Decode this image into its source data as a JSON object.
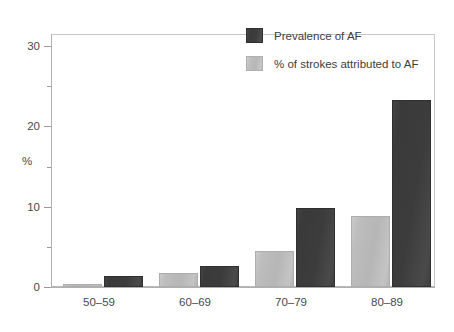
{
  "chart_data": {
    "type": "bar",
    "title": "",
    "subtitle": "",
    "xlabel": "",
    "ylabel": "%",
    "categories": [
      "50–59",
      "60–69",
      "70–79",
      "80–89"
    ],
    "series": [
      {
        "name": "Prevalence of AF",
        "color": "#3c3c3c",
        "values": [
          1.4,
          2.6,
          9.9,
          23.3
        ]
      },
      {
        "name": "% of strokes attributed to AF",
        "color": "#bdbdbd",
        "values": [
          0.4,
          1.7,
          4.5,
          8.8
        ]
      }
    ],
    "ylim": [
      0,
      31.5
    ],
    "yticks_major": [
      0,
      10,
      20,
      30
    ],
    "yticks_minor": [
      5,
      15,
      25
    ],
    "ytick_labels": [
      "0",
      "10",
      "20",
      "30"
    ],
    "grid": false,
    "legend_position": "top-right"
  },
  "legend": {
    "entries": [
      {
        "label": "Prevalence of AF",
        "swatch": "dark"
      },
      {
        "label": "% of strokes attributed to AF",
        "swatch": "light"
      }
    ]
  },
  "axis": {
    "y_title": "%",
    "y_labels": [
      "30",
      "20",
      "10",
      "0"
    ],
    "x_labels": [
      "50–59",
      "60–69",
      "70–79",
      "80–89"
    ]
  },
  "colors": {
    "dark_series": "#3c3c3c",
    "light_series": "#bdbdbd",
    "axis": "#b0b0b0",
    "text": "#4a4a4a",
    "background": "#ffffff"
  }
}
